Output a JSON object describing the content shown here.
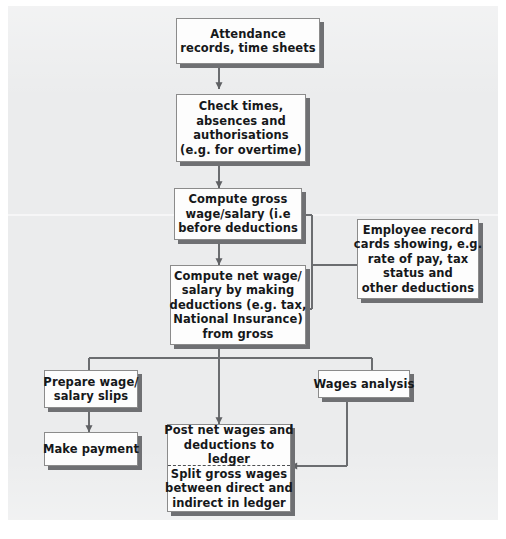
{
  "diagram": {
    "background_color": "#ebeced",
    "node_fill": "#fdfdfd",
    "node_border": "#8b8b8b",
    "shadow_color": "#6f7073",
    "text_color": "#16181a",
    "connector_color": "#6b6d70"
  },
  "nodes": {
    "attendance": {
      "name": "attendance-records-node",
      "lines": [
        "Attendance",
        "records, time sheets"
      ]
    },
    "check_times": {
      "name": "check-times-node",
      "lines": [
        "Check times,",
        "absences and",
        "authorisations",
        "(e.g. for overtime)"
      ]
    },
    "compute_gross": {
      "name": "compute-gross-node",
      "lines": [
        "Compute gross",
        "wage/salary (i.e",
        "before deductions"
      ]
    },
    "compute_net": {
      "name": "compute-net-node",
      "lines": [
        "Compute net wage/",
        "salary by making",
        "deductions (e.g. tax,",
        "National Insurance)",
        "from gross"
      ]
    },
    "employee_records": {
      "name": "employee-record-cards-node",
      "lines": [
        "Employee record",
        "cards showing, e.g.",
        "rate of pay, tax",
        "status and",
        "other deductions"
      ]
    },
    "prepare_slips": {
      "name": "prepare-wage-slips-node",
      "lines": [
        "Prepare wage/",
        "salary slips"
      ]
    },
    "make_payment": {
      "name": "make-payment-node",
      "lines": [
        "Make payment"
      ]
    },
    "wages_analysis": {
      "name": "wages-analysis-node",
      "lines": [
        "Wages analysis"
      ]
    },
    "post_ledger": {
      "name": "post-to-ledger-node",
      "top_lines": [
        "Post net wages and",
        "deductions to",
        "ledger"
      ],
      "bottom_lines": [
        "Split gross wages",
        "between direct and",
        "indirect in ledger"
      ]
    }
  },
  "connectors": [
    {
      "name": "attendance-to-check-times",
      "from": "attendance",
      "to": "check_times",
      "arrow": true
    },
    {
      "name": "check-times-to-compute-gross",
      "from": "check_times",
      "to": "compute_gross",
      "arrow": true
    },
    {
      "name": "compute-gross-to-compute-net",
      "from": "compute_gross",
      "to": "compute_net",
      "arrow": true
    },
    {
      "name": "employee-records-to-compute-gross",
      "from": "employee_records",
      "to": "compute_gross",
      "arrow": true
    },
    {
      "name": "employee-records-to-compute-net",
      "from": "employee_records",
      "to": "compute_net",
      "arrow": true
    },
    {
      "name": "compute-net-to-prepare-slips",
      "from": "compute_net",
      "to": "prepare_slips",
      "arrow": false
    },
    {
      "name": "compute-net-to-wages-analysis",
      "from": "compute_net",
      "to": "wages_analysis",
      "arrow": false
    },
    {
      "name": "compute-net-to-post-ledger",
      "from": "compute_net",
      "to": "post_ledger",
      "arrow": true
    },
    {
      "name": "prepare-slips-to-make-payment",
      "from": "prepare_slips",
      "to": "make_payment",
      "arrow": true
    },
    {
      "name": "wages-analysis-to-post-ledger",
      "from": "wages_analysis",
      "to": "post_ledger",
      "arrow": true
    }
  ]
}
